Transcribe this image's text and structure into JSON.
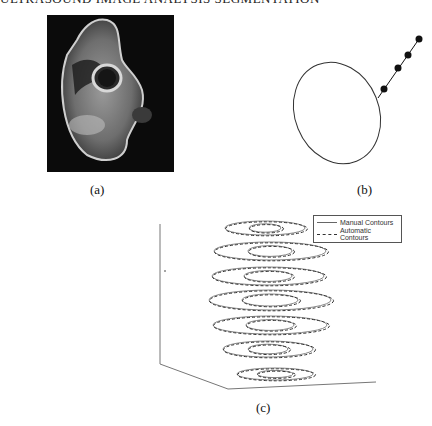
{
  "header": {
    "text": "ULTRASOUND IMAGE ANALYSIS SEGMENTATION"
  },
  "panels": [
    {
      "id": "a",
      "label": "(a)",
      "content": "mri-cross-section-image"
    },
    {
      "id": "b",
      "label": "(b)",
      "content": "ellipse-with-radial-points"
    },
    {
      "id": "c",
      "label": "(c)",
      "content": "3d-contour-stack"
    }
  ],
  "legend": {
    "items": [
      {
        "label": "Manual Contours",
        "style": "solid"
      },
      {
        "label": "Automatic Contours",
        "style": "dashed"
      }
    ]
  },
  "colors": {
    "image_bg": "#0b0b0b",
    "line": "#333333"
  }
}
